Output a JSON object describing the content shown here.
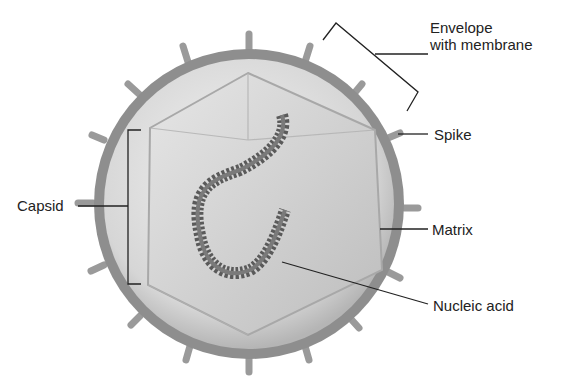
{
  "figure": {
    "labels": {
      "envelope_line1": "Envelope",
      "envelope_line2": "with membrane",
      "spike": "Spike",
      "capsid": "Capsid",
      "matrix": "Matrix",
      "nucleic_acid": "Nucleic acid"
    },
    "colors": {
      "envelope": "#8a8a8a",
      "matrix": "#d9d9d9",
      "capsid": "#c4c4c4",
      "nucleic_acid": "#555555",
      "leader_line": "#222222"
    }
  }
}
